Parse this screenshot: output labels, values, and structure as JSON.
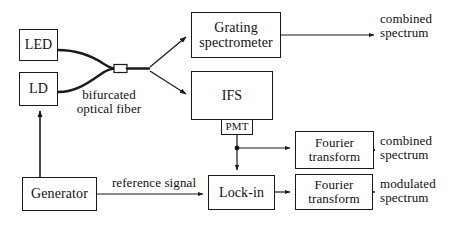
{
  "diagram": {
    "stroke_color": "#1a1a1a",
    "text_color": "#111111",
    "background": "#ffffff",
    "nodes": {
      "led": "LED",
      "ld": "LD",
      "grating_spectrometer": "Grating\nspectrometer",
      "ifs": "IFS",
      "pmt": "PMT",
      "fourier_transform_1": "Fourier\ntransform",
      "fourier_transform_2": "Fourier\ntransform",
      "lock_in": "Lock-in",
      "generator": "Generator"
    },
    "labels": {
      "bifurcated_optical_fiber": "bifurcated\noptical fiber",
      "reference_signal": "reference signal",
      "output_combined_spectrum_grating": "combined\nspectrum",
      "output_combined_spectrum_ft": "combined\nspectrum",
      "output_modulated_spectrum": "modulated\nspectrum"
    }
  }
}
